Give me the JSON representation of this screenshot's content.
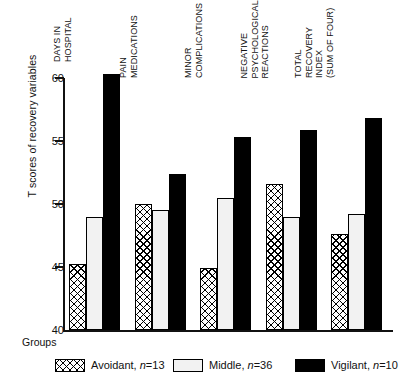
{
  "chart_data": {
    "type": "bar",
    "title": "",
    "xlabel": "Groups",
    "ylabel": "T scores of recovery variables",
    "ylim": [
      40,
      60
    ],
    "yticks": [
      40,
      45,
      50,
      55,
      60
    ],
    "grid": false,
    "legend_position": "bottom",
    "categories": [
      "DAYS IN HOSPITAL",
      "PAIN MEDICATIONS",
      "MINOR COMPLICATIONS",
      "NEGATIVE PSYCHOLOGICAL REACTIONS",
      "TOTAL RECOVERY INDEX (SUM OF FOUR)"
    ],
    "category_lines": [
      [
        "DAYS IN",
        "HOSPITAL"
      ],
      [
        "PAIN",
        "MEDICATIONS"
      ],
      [
        "MINOR",
        "COMPLICATIONS"
      ],
      [
        "NEGATIVE",
        "PSYCHOLOGICAL",
        "REACTIONS"
      ],
      [
        "TOTAL",
        "RECOVERY",
        "INDEX",
        "(SUM OF FOUR)"
      ]
    ],
    "series": [
      {
        "name": "Avoidant",
        "n": 13,
        "pattern": "crosshatch",
        "color": "#ffffff",
        "values": [
          45.2,
          50.0,
          44.9,
          51.6,
          47.6
        ]
      },
      {
        "name": "Middle",
        "n": 36,
        "pattern": "stipple",
        "color": "#f2f2f2",
        "values": [
          49.0,
          49.5,
          50.5,
          49.0,
          49.2
        ]
      },
      {
        "name": "Vigilant",
        "n": 10,
        "pattern": "solid",
        "color": "#000000",
        "values": [
          60.3,
          52.4,
          55.3,
          55.9,
          56.8
        ]
      }
    ]
  },
  "axis": {
    "y_title": "T scores of recovery variables",
    "x_title": "Groups",
    "tick_labels": [
      "60",
      "55",
      "50",
      "45",
      "40"
    ]
  },
  "legend": {
    "items": [
      {
        "label": "Avoidant,",
        "n_prefix": "n",
        "n_value": "=13"
      },
      {
        "label": "Middle,",
        "n_prefix": "n",
        "n_value": "=36"
      },
      {
        "label": "Vigilant,",
        "n_prefix": "n",
        "n_value": "=10"
      }
    ]
  }
}
